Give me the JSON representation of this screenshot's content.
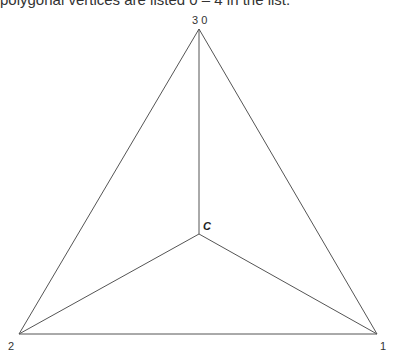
{
  "caption": "polygonal vertices are listed 0 – 4 in the list.",
  "diagram": {
    "type": "triangle-fan",
    "vertices": [
      {
        "id": "0",
        "x": 199,
        "y": 29
      },
      {
        "id": "1",
        "x": 377,
        "y": 334
      },
      {
        "id": "2",
        "x": 19,
        "y": 334
      },
      {
        "id": "3",
        "x": 199,
        "y": 29
      }
    ],
    "center": {
      "id": "C",
      "x": 199,
      "y": 234
    },
    "labels": {
      "top": "3 0",
      "center": "C",
      "bottom_left": "2",
      "bottom_right": "1"
    },
    "line_color": "#555555"
  }
}
